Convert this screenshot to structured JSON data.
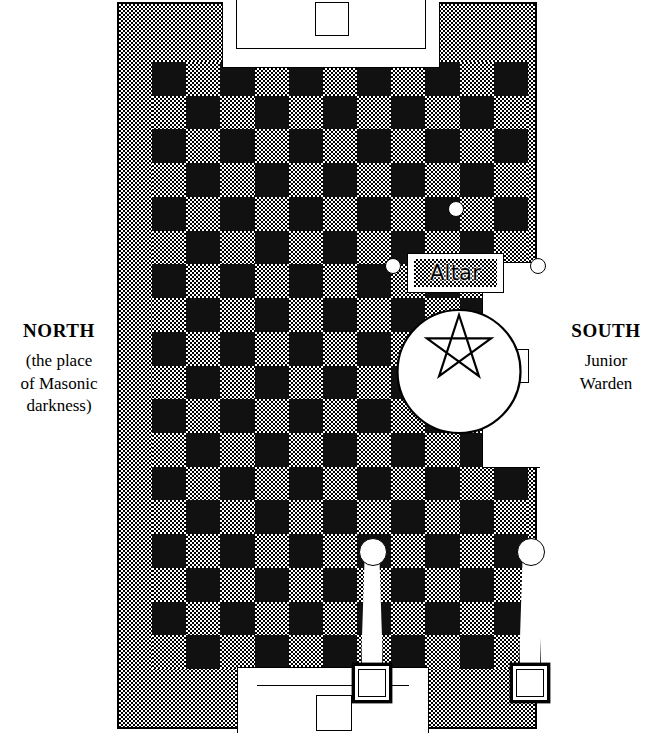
{
  "diagram": {
    "altar": {
      "label": "Altar"
    },
    "north": {
      "heading": "NORTH",
      "sub_line_1": "(the place",
      "sub_line_2": "of Masonic",
      "sub_line_3": "darkness)"
    },
    "south": {
      "heading": "SOUTH",
      "sub_line_1": "Junior",
      "sub_line_2": "Warden"
    },
    "stations": {
      "east_label": "east-station-worshipful-master",
      "south_label": "south-station-junior-warden",
      "west_label": "west-station-senior-warden"
    },
    "elements": {
      "pentagram": "five-pointed-star-in-circle",
      "checkerboard": "mosaic-pavement",
      "pillar_left": "left-pillar-with-globe",
      "pillar_right": "right-pillar-with-globe",
      "lesser_lights": "three-lesser-lights"
    },
    "colors": {
      "ink": "#000000",
      "paper": "#ffffff",
      "dark_tile": "#111111",
      "light_tile_pattern": "#808080"
    },
    "floor": {
      "columns": 11,
      "rows": 18
    }
  }
}
